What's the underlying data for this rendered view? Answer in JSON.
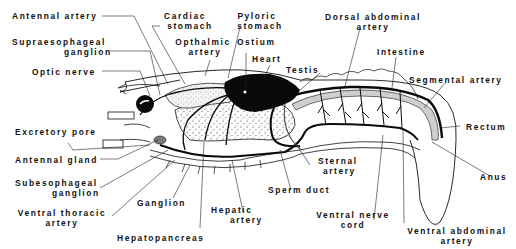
{
  "diagram": {
    "labels": {
      "antennal_artery": "Antennal artery",
      "cardiac_stomach_1": "Cardiac",
      "cardiac_stomach_2": "stomach",
      "pyloric_stomach_1": "Pyloric",
      "pyloric_stomach_2": "stomach",
      "dorsal_abdominal_artery_1": "Dorsal abdominal",
      "dorsal_abdominal_artery_2": "artery",
      "supraesophageal_ganglion_1": "Supraesophageal",
      "supraesophageal_ganglion_2": "ganglion",
      "opthalmic_artery_1": "Opthalmic",
      "opthalmic_artery_2": "artery",
      "ostium": "Ostium",
      "heart": "Heart",
      "intestine": "Intestine",
      "testis": "Testis",
      "optic_nerve": "Optic nerve",
      "segmental_artery": "Segmental artery",
      "excretory_pore": "Excretory pore",
      "rectum": "Rectum",
      "antennal_gland": "Antennal gland",
      "sternal_artery_1": "Sternal",
      "sternal_artery_2": "artery",
      "subesophageal_ganglion_1": "Subesophageal",
      "subesophageal_ganglion_2": "ganglion",
      "anus": "Anus",
      "sperm_duct": "Sperm duct",
      "ganglion": "Ganglion",
      "hepatic_artery_1": "Hepatic",
      "hepatic_artery_2": "artery",
      "ventral_nerve_cord_1": "Ventral nerve",
      "ventral_nerve_cord_2": "cord",
      "ventral_thoracic_artery_1": "Ventral thoracic",
      "ventral_thoracic_artery_2": "artery",
      "ventral_abdominal_artery_1": "Ventral abdominal",
      "ventral_abdominal_artery_2": "artery",
      "hepatopancreas": "Hepatopancreas"
    },
    "colors": {
      "ink": "#111111",
      "background": "#ffffff",
      "stipple_fill": "#e8e8e8",
      "gland_fill": "#7a7a7a"
    }
  }
}
